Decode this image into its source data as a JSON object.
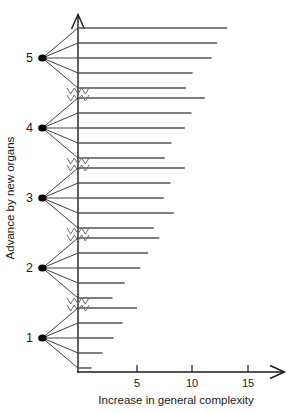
{
  "figure": {
    "title": "",
    "background_color": "#ffffff",
    "line_color": "#1a1a1a"
  },
  "chart_data": {
    "type": "scatter",
    "title": "",
    "subtitle": "",
    "xlabel": "Increase in general complexity",
    "ylabel": "Advance by new organs",
    "xlim": [
      0,
      17
    ],
    "ylim": [
      0.4,
      5.8
    ],
    "grid": false,
    "legend": false,
    "legend_position": "none",
    "x_ticks": [
      5,
      10,
      15
    ],
    "x_tick_labels": [
      "5",
      "10",
      "15"
    ],
    "y_ticks": [
      1,
      2,
      3,
      4,
      5
    ],
    "y_tick_labels": [
      "1",
      "2",
      "3",
      "4",
      "5"
    ],
    "y_axis_breaks": [
      1.5,
      2.5,
      3.5,
      4.5
    ],
    "y_axis_break_style": "double-zigzag",
    "x_axis_arrow": true,
    "y_axis_arrow": true,
    "nodes": [
      {
        "label": "5",
        "y": 5,
        "node_x": -3.2,
        "branch_lengths": [
          13.4,
          12.5,
          12.0,
          10.3,
          9.7
        ]
      },
      {
        "label": "4",
        "y": 4,
        "node_x": -3.2,
        "branch_lengths": [
          11.4,
          10.2,
          9.6,
          8.4,
          7.8
        ]
      },
      {
        "label": "3",
        "y": 3,
        "node_x": -3.2,
        "branch_lengths": [
          9.6,
          8.3,
          7.7,
          8.6,
          6.8
        ]
      },
      {
        "label": "2",
        "y": 2,
        "node_x": -3.2,
        "branch_lengths": [
          7.3,
          6.3,
          5.6,
          4.2,
          3.1
        ]
      },
      {
        "label": "1",
        "y": 1,
        "node_x": -3.2,
        "branch_lengths": [
          5.3,
          4.0,
          3.2,
          2.2,
          1.2
        ]
      }
    ]
  }
}
